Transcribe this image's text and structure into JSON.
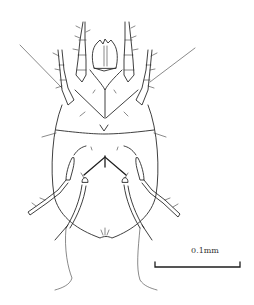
{
  "figure": {
    "scale_bar": {
      "label": "0.1mm",
      "color": "#222222"
    },
    "line_color": "#2a2a2a",
    "background": "#ffffff"
  }
}
